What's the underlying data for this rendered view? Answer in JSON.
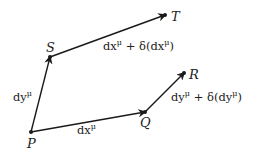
{
  "diagram": {
    "points": {
      "P": {
        "label": "P",
        "x": 31,
        "y": 132
      },
      "Q": {
        "label": "Q",
        "x": 145,
        "y": 112
      },
      "R": {
        "label": "R",
        "x": 184,
        "y": 73
      },
      "S": {
        "label": "S",
        "x": 50,
        "y": 57
      },
      "T": {
        "label": "T",
        "x": 165,
        "y": 15
      }
    },
    "edges": [
      {
        "from": "P",
        "to": "S",
        "label_base": "dy",
        "label_sup": "μ",
        "label_tail": ""
      },
      {
        "from": "P",
        "to": "Q",
        "label_base": "dx",
        "label_sup": "μ",
        "label_tail": ""
      },
      {
        "from": "S",
        "to": "T",
        "label_base": "dx",
        "label_sup": "μ",
        "label_tail": " + δ(dx",
        "label_sup2": "μ",
        "label_end": ")"
      },
      {
        "from": "Q",
        "to": "R",
        "label_base": "dy",
        "label_sup": "μ",
        "label_tail": " + δ(dy",
        "label_sup2": "μ",
        "label_end": ")"
      }
    ],
    "colors": {
      "line": "#1a1a1a",
      "text": "#222222",
      "background": "#ffffff"
    }
  }
}
